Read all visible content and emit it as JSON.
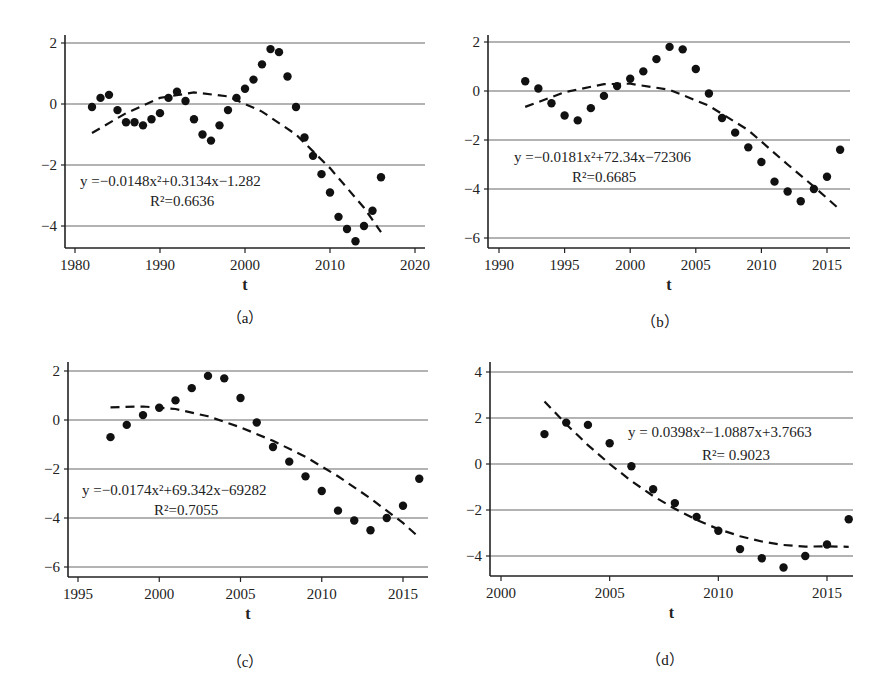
{
  "figure": {
    "panels": [
      {
        "id": "a",
        "caption": "（a）",
        "xlabel": "t",
        "equation": "y =−0.0148x²+0.3134x−1.282",
        "r2": "R²=0.6636"
      },
      {
        "id": "b",
        "caption": "（b）",
        "xlabel": "t",
        "equation": "y =−0.0181x²+72.34x−72306",
        "r2": "R²=0.6685"
      },
      {
        "id": "c",
        "caption": "（c）",
        "xlabel": "t",
        "equation": "y =−0.0174x²+69.342x−69282",
        "r2": "R²=0.7055"
      },
      {
        "id": "d",
        "caption": "（d）",
        "xlabel": "t",
        "equation": "y = 0.0398x²−1.0887x+3.7663",
        "r2": "R²= 0.9023"
      }
    ]
  },
  "chart_data": [
    {
      "type": "scatter",
      "panel": "a",
      "title": "",
      "xlabel": "t",
      "ylabel": "",
      "xlim": [
        1980,
        2020
      ],
      "ylim": [
        -4.6,
        2.3
      ],
      "xticks": [
        1980,
        1990,
        2000,
        2010,
        2020
      ],
      "yticks": [
        2,
        0,
        -2,
        -4
      ],
      "grid": "horizontal",
      "x": [
        1982,
        1983,
        1984,
        1985,
        1986,
        1987,
        1988,
        1989,
        1990,
        1991,
        1992,
        1993,
        1994,
        1995,
        1996,
        1997,
        1998,
        1999,
        2000,
        2001,
        2002,
        2003,
        2004,
        2005,
        2006,
        2007,
        2008,
        2009,
        2010,
        2011,
        2012,
        2013,
        2014,
        2015,
        2016
      ],
      "y": [
        -0.1,
        0.2,
        0.3,
        -0.2,
        -0.6,
        -0.6,
        -0.7,
        -0.5,
        -0.3,
        0.2,
        0.4,
        0.1,
        -0.5,
        -1.0,
        -1.2,
        -0.7,
        -0.2,
        0.2,
        0.5,
        0.8,
        1.3,
        1.8,
        1.7,
        0.9,
        -0.1,
        -1.1,
        -1.7,
        -2.3,
        -2.9,
        -3.7,
        -4.1,
        -4.5,
        -4.0,
        -3.5,
        -2.4
      ],
      "trend": {
        "type": "quadratic",
        "equation": "y = -0.0148x^2 + 0.3134x - 1.282",
        "r2": 0.6636,
        "x_from": 1982,
        "x_to": 2016,
        "curve": [
          [
            1982,
            -0.95
          ],
          [
            1986,
            -0.3
          ],
          [
            1990,
            0.2
          ],
          [
            1994,
            0.38
          ],
          [
            1998,
            0.25
          ],
          [
            2002,
            -0.25
          ],
          [
            2006,
            -1.0
          ],
          [
            2010,
            -2.1
          ],
          [
            2014,
            -3.4
          ],
          [
            2016,
            -4.2
          ]
        ]
      }
    },
    {
      "type": "scatter",
      "panel": "b",
      "title": "",
      "xlabel": "t",
      "ylabel": "",
      "xlim": [
        1989,
        2016.5
      ],
      "ylim": [
        -6.2,
        2.3
      ],
      "xticks": [
        1990,
        1995,
        2000,
        2005,
        2010,
        2015
      ],
      "yticks": [
        2,
        0,
        -2,
        -4,
        -6
      ],
      "grid": "horizontal",
      "x": [
        1992,
        1993,
        1994,
        1995,
        1996,
        1997,
        1998,
        1999,
        2000,
        2001,
        2002,
        2003,
        2004,
        2005,
        2006,
        2007,
        2008,
        2009,
        2010,
        2011,
        2012,
        2013,
        2014,
        2015,
        2016
      ],
      "y": [
        0.4,
        0.1,
        -0.5,
        -1.0,
        -1.2,
        -0.7,
        -0.2,
        0.2,
        0.5,
        0.8,
        1.3,
        1.8,
        1.7,
        0.9,
        -0.1,
        -1.1,
        -1.7,
        -2.3,
        -2.9,
        -3.7,
        -4.1,
        -4.5,
        -4.0,
        -3.5,
        -2.4
      ],
      "trend": {
        "type": "quadratic",
        "equation": "y = -0.0181x^2 + 72.34x - 72306",
        "r2": 0.6685,
        "x_from": 1992,
        "x_to": 2016,
        "curve": [
          [
            1992,
            -0.65
          ],
          [
            1995,
            -0.05
          ],
          [
            1998,
            0.28
          ],
          [
            2000,
            0.3
          ],
          [
            2003,
            0.05
          ],
          [
            2006,
            -0.6
          ],
          [
            2009,
            -1.6
          ],
          [
            2012,
            -3.0
          ],
          [
            2014,
            -3.9
          ],
          [
            2016,
            -4.85
          ]
        ]
      }
    },
    {
      "type": "scatter",
      "panel": "c",
      "title": "",
      "xlabel": "t",
      "ylabel": "",
      "xlim": [
        1994.5,
        2016.5
      ],
      "ylim": [
        -6.2,
        2.3
      ],
      "xticks": [
        1995,
        2000,
        2005,
        2010,
        2015
      ],
      "yticks": [
        2,
        0,
        -2,
        -4,
        -6
      ],
      "grid": "horizontal",
      "x": [
        1997,
        1998,
        1999,
        2000,
        2001,
        2002,
        2003,
        2004,
        2005,
        2006,
        2007,
        2008,
        2009,
        2010,
        2011,
        2012,
        2013,
        2014,
        2015,
        2016
      ],
      "y": [
        -0.7,
        -0.2,
        0.2,
        0.5,
        0.8,
        1.3,
        1.8,
        1.7,
        0.9,
        -0.1,
        -1.1,
        -1.7,
        -2.3,
        -2.9,
        -3.7,
        -4.1,
        -4.5,
        -4.0,
        -3.5,
        -2.4
      ],
      "trend": {
        "type": "quadratic",
        "equation": "y = -0.0174x^2 + 69.342x - 69282",
        "r2": 0.7055,
        "x_from": 1997,
        "x_to": 2016,
        "curve": [
          [
            1997,
            0.52
          ],
          [
            1999,
            0.55
          ],
          [
            2001,
            0.45
          ],
          [
            2003,
            0.15
          ],
          [
            2005,
            -0.3
          ],
          [
            2007,
            -0.85
          ],
          [
            2009,
            -1.5
          ],
          [
            2011,
            -2.3
          ],
          [
            2013,
            -3.2
          ],
          [
            2015,
            -4.2
          ],
          [
            2016,
            -4.8
          ]
        ]
      }
    },
    {
      "type": "scatter",
      "panel": "d",
      "title": "",
      "xlabel": "t",
      "ylabel": "",
      "xlim": [
        1999.5,
        2016.5
      ],
      "ylim": [
        -4.8,
        4.3
      ],
      "xticks": [
        2000,
        2005,
        2010,
        2015
      ],
      "yticks": [
        4,
        2,
        0,
        -2,
        -4
      ],
      "grid": "horizontal",
      "x": [
        2002,
        2003,
        2004,
        2005,
        2006,
        2007,
        2008,
        2009,
        2010,
        2011,
        2012,
        2013,
        2014,
        2015,
        2016
      ],
      "y": [
        1.3,
        1.8,
        1.7,
        0.9,
        -0.1,
        -1.1,
        -1.7,
        -2.3,
        -2.9,
        -3.7,
        -4.1,
        -4.5,
        -4.0,
        -3.5,
        -2.4
      ],
      "trend": {
        "type": "quadratic",
        "equation": "y = 0.0398x^2 - 1.0887x + 3.7663",
        "r2": 0.9023,
        "x_from": 2002,
        "x_to": 2016,
        "curve": [
          [
            2002,
            2.72
          ],
          [
            2003,
            1.73
          ],
          [
            2004,
            0.82
          ],
          [
            2005,
            0.0
          ],
          [
            2006,
            -0.74
          ],
          [
            2007,
            -1.39
          ],
          [
            2008,
            -1.95
          ],
          [
            2009,
            -2.43
          ],
          [
            2010,
            -2.83
          ],
          [
            2011,
            -3.14
          ],
          [
            2012,
            -3.37
          ],
          [
            2013,
            -3.52
          ],
          [
            2014,
            -3.59
          ],
          [
            2015,
            -3.58
          ],
          [
            2016,
            -3.6
          ]
        ]
      }
    }
  ]
}
